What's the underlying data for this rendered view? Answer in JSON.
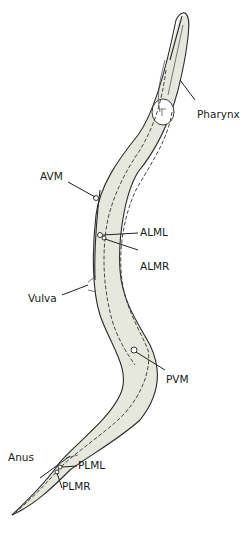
{
  "diagram": {
    "body_fill": "#e6e8de",
    "outline_color": "#2a2a2a",
    "labels": [
      {
        "id": "pharynx",
        "text": "Pharynx"
      },
      {
        "id": "avm",
        "text": "AVM"
      },
      {
        "id": "alml",
        "text": "ALML"
      },
      {
        "id": "almr",
        "text": "ALMR"
      },
      {
        "id": "vulva",
        "text": "Vulva"
      },
      {
        "id": "pvm",
        "text": "PVM"
      },
      {
        "id": "anus",
        "text": "Anus"
      },
      {
        "id": "plml",
        "text": "PLML"
      },
      {
        "id": "plmr",
        "text": "PLMR"
      }
    ]
  }
}
